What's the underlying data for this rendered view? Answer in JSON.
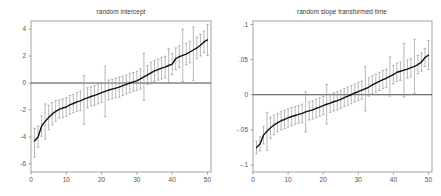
{
  "figure": {
    "background_color": "#ffffff",
    "panel_count": 2
  },
  "chart_data": [
    {
      "type": "scatter",
      "title": "random intercept",
      "subtitle": "",
      "xlabel": "",
      "ylabel": "",
      "xlim": [
        0,
        51
      ],
      "ylim": [
        -6.6,
        4.6
      ],
      "grid": false,
      "legend": null,
      "xticks": [
        0,
        10,
        20,
        30,
        40,
        50
      ],
      "xtick_labels": [
        "0",
        "10",
        "20",
        "30",
        "40",
        "50"
      ],
      "yticks": [
        4,
        2,
        0,
        -2,
        -4,
        -6
      ],
      "ytick_labels": [
        "4",
        "2",
        "0",
        "-2",
        "-4",
        "-6"
      ],
      "annotations": [
        "horizontal reference line at y = 0"
      ],
      "series": [
        {
          "name": "random intercept estimate",
          "x": [
            1,
            2,
            3,
            4,
            5,
            6,
            7,
            8,
            9,
            10,
            11,
            12,
            13,
            14,
            15,
            16,
            17,
            18,
            19,
            20,
            21,
            22,
            23,
            24,
            25,
            26,
            27,
            28,
            29,
            30,
            31,
            32,
            33,
            34,
            35,
            36,
            37,
            38,
            39,
            40,
            41,
            42,
            43,
            44,
            45,
            46,
            47,
            48,
            49,
            50
          ],
          "values": [
            -4.3,
            -4.0,
            -3.2,
            -2.85,
            -2.55,
            -2.3,
            -2.1,
            -1.95,
            -1.85,
            -1.78,
            -1.62,
            -1.52,
            -1.4,
            -1.32,
            -1.2,
            -1.1,
            -1.0,
            -0.92,
            -0.82,
            -0.72,
            -0.62,
            -0.52,
            -0.45,
            -0.38,
            -0.3,
            -0.2,
            -0.1,
            0.0,
            0.08,
            0.16,
            0.3,
            0.45,
            0.6,
            0.75,
            0.9,
            1.0,
            1.1,
            1.18,
            1.3,
            1.4,
            1.8,
            1.95,
            2.05,
            2.15,
            2.3,
            2.45,
            2.6,
            2.8,
            3.05,
            3.2
          ],
          "ci_lower": [
            -5.5,
            -4.75,
            -3.95,
            -4.15,
            -3.45,
            -3.1,
            -2.85,
            -2.6,
            -2.55,
            -2.48,
            -2.32,
            -2.2,
            -2.1,
            -2.05,
            -3.05,
            -1.85,
            -1.7,
            -1.65,
            -1.55,
            -1.45,
            -2.5,
            -1.25,
            -1.18,
            -1.1,
            -1.05,
            -0.92,
            -0.8,
            -0.72,
            -0.6,
            -0.55,
            -0.45,
            -1.3,
            -0.1,
            -0.05,
            0.12,
            0.22,
            0.3,
            0.38,
            0.05,
            0.62,
            1.0,
            1.15,
            0.1,
            1.35,
            1.5,
            0.2,
            1.8,
            2.0,
            2.25,
            2.05
          ],
          "ci_upper": [
            -3.35,
            -3.2,
            -2.45,
            -1.55,
            -1.65,
            -1.45,
            -1.3,
            -1.25,
            -1.18,
            -1.08,
            -0.92,
            -0.85,
            -0.7,
            -0.6,
            0.55,
            -0.35,
            -0.28,
            -0.18,
            -0.08,
            0.02,
            1.25,
            0.22,
            0.28,
            0.35,
            0.45,
            0.52,
            0.6,
            0.72,
            0.78,
            0.88,
            1.05,
            2.2,
            1.3,
            1.55,
            1.68,
            1.78,
            1.9,
            1.98,
            2.55,
            2.18,
            2.6,
            2.75,
            4.0,
            2.95,
            3.1,
            4.15,
            3.4,
            3.6,
            3.85,
            4.35
          ]
        }
      ]
    },
    {
      "type": "scatter",
      "title": "random slope transformed time",
      "subtitle": "",
      "xlabel": "",
      "ylabel": "",
      "xlim": [
        0,
        51
      ],
      "ylim": [
        -0.11,
        0.105
      ],
      "grid": false,
      "legend": null,
      "xticks": [
        0,
        10,
        20,
        30,
        40,
        50
      ],
      "xtick_labels": [
        "0",
        "10",
        "20",
        "30",
        "40",
        "50"
      ],
      "yticks": [
        0.1,
        0.05,
        0,
        -0.05,
        -0.1
      ],
      "ytick_labels": [
        ".1",
        ".05",
        "0",
        "-.05",
        "-.1"
      ],
      "annotations": [
        "horizontal reference line at y = 0"
      ],
      "series": [
        {
          "name": "random slope estimate",
          "x": [
            1,
            2,
            3,
            4,
            5,
            6,
            7,
            8,
            9,
            10,
            11,
            12,
            13,
            14,
            15,
            16,
            17,
            18,
            19,
            20,
            21,
            22,
            23,
            24,
            25,
            26,
            27,
            28,
            29,
            30,
            31,
            32,
            33,
            34,
            35,
            36,
            37,
            38,
            39,
            40,
            41,
            42,
            43,
            44,
            45,
            46,
            47,
            48,
            49,
            50
          ],
          "values": [
            -0.075,
            -0.07,
            -0.0575,
            -0.052,
            -0.047,
            -0.043,
            -0.04,
            -0.037,
            -0.035,
            -0.033,
            -0.031,
            -0.0295,
            -0.028,
            -0.0265,
            -0.0245,
            -0.023,
            -0.0215,
            -0.0195,
            -0.0175,
            -0.0155,
            -0.0135,
            -0.012,
            -0.01,
            -0.0085,
            -0.0065,
            -0.004,
            -0.002,
            0.0,
            0.0025,
            0.0045,
            0.0065,
            0.0085,
            0.011,
            0.014,
            0.0165,
            0.019,
            0.0215,
            0.0235,
            0.026,
            0.0285,
            0.032,
            0.0335,
            0.035,
            0.0365,
            0.0385,
            0.0405,
            0.043,
            0.0465,
            0.053,
            0.0565
          ],
          "ci_lower": [
            -0.084,
            -0.08,
            -0.07,
            -0.079,
            -0.062,
            -0.057,
            -0.053,
            -0.05,
            -0.048,
            -0.046,
            -0.044,
            -0.042,
            -0.0405,
            -0.0395,
            -0.053,
            -0.036,
            -0.0345,
            -0.0325,
            -0.0305,
            -0.0285,
            -0.0415,
            -0.025,
            -0.023,
            -0.0215,
            -0.0195,
            -0.017,
            -0.015,
            -0.013,
            -0.0105,
            -0.0085,
            -0.0065,
            -0.023,
            -0.002,
            0.001,
            0.0035,
            0.006,
            0.0085,
            0.0105,
            -0.002,
            0.0155,
            0.019,
            0.0205,
            -0.003,
            0.0235,
            0.0255,
            0.002,
            0.03,
            0.0335,
            0.04,
            0.0355
          ],
          "ci_upper": [
            -0.066,
            -0.06,
            -0.045,
            -0.025,
            -0.032,
            -0.029,
            -0.027,
            -0.024,
            -0.022,
            -0.02,
            -0.018,
            -0.017,
            -0.0155,
            -0.0135,
            0.004,
            -0.01,
            -0.0085,
            -0.0065,
            -0.0045,
            -0.0025,
            0.0145,
            0.001,
            0.003,
            0.0045,
            0.0065,
            0.009,
            0.011,
            0.013,
            0.0155,
            0.0175,
            0.0195,
            0.04,
            0.024,
            0.027,
            0.0295,
            0.032,
            0.0345,
            0.0365,
            0.054,
            0.0415,
            0.045,
            0.0465,
            0.073,
            0.0495,
            0.0515,
            0.079,
            0.056,
            0.0595,
            0.066,
            0.0775
          ]
        }
      ]
    }
  ]
}
